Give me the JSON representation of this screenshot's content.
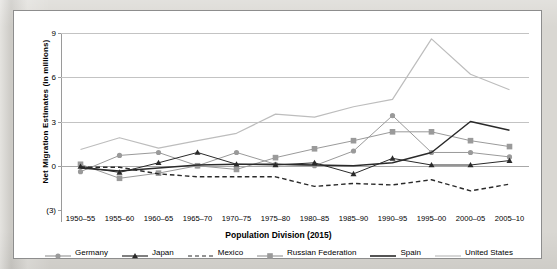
{
  "chart_data": {
    "type": "line",
    "title": "",
    "xlabel": "Population Division (2015)",
    "ylabel": "Net Migration Estimates (in millions)",
    "categories": [
      "1950–55",
      "1955–60",
      "1960–65",
      "1965–70",
      "1970–75",
      "1975–80",
      "1980–85",
      "1985–90",
      "1990–95",
      "1995–00",
      "2000–05",
      "2005–10"
    ],
    "ylim": [
      -3,
      9
    ],
    "yticks": [
      9,
      6,
      3,
      0,
      -3
    ],
    "ytick_labels": [
      "9",
      "6",
      "3",
      "0",
      "(3)"
    ],
    "grid": true,
    "legend_position": "bottom",
    "series": [
      {
        "name": "Germany",
        "color": "#9a9a9a",
        "marker": "circle",
        "dash": "solid",
        "values": [
          -0.4,
          0.7,
          0.9,
          0.0,
          0.9,
          0.1,
          0.0,
          1.0,
          3.4,
          0.9,
          0.9,
          0.6
        ]
      },
      {
        "name": "Japan",
        "color": "#2a2a2a",
        "marker": "triangle",
        "dash": "solid",
        "values": [
          -0.05,
          -0.45,
          0.2,
          0.9,
          0.1,
          0.05,
          0.2,
          -0.55,
          0.5,
          0.05,
          0.05,
          0.35
        ]
      },
      {
        "name": "Mexico",
        "color": "#2a2a2a",
        "marker": "none",
        "dash": "dashed",
        "values": [
          -0.1,
          -0.1,
          -0.55,
          -0.75,
          -0.75,
          -0.75,
          -1.4,
          -1.2,
          -1.3,
          -0.95,
          -1.7,
          -1.25
        ]
      },
      {
        "name": "Russian Federation",
        "color": "#9a9a9a",
        "marker": "square",
        "dash": "solid",
        "values": [
          0.1,
          -0.85,
          -0.5,
          0.0,
          -0.25,
          0.55,
          1.15,
          1.7,
          2.3,
          2.3,
          1.7,
          1.3
        ]
      },
      {
        "name": "Spain",
        "color": "#2a2a2a",
        "marker": "none",
        "dash": "solid",
        "values": [
          -0.15,
          -0.35,
          -0.15,
          0.05,
          0.1,
          0.1,
          0.05,
          0.0,
          0.2,
          0.9,
          3.0,
          2.4
        ]
      },
      {
        "name": "United States",
        "color": "#bdbdbd",
        "marker": "none",
        "dash": "solid",
        "values": [
          1.1,
          1.9,
          1.2,
          1.7,
          2.2,
          3.5,
          3.3,
          4.0,
          4.5,
          8.6,
          6.2,
          5.15
        ]
      }
    ]
  },
  "axis": {
    "y_title": "Net Migration Estimates (in millions)",
    "x_title": "Population Division (2015)"
  }
}
